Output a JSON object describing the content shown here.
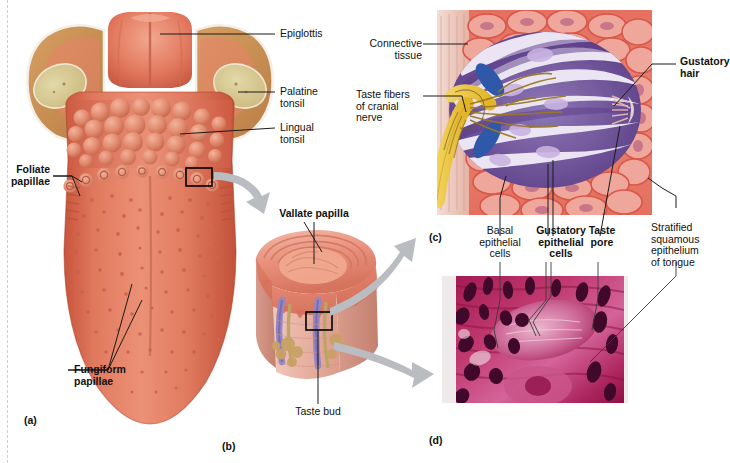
{
  "figure": {
    "background": "#ffffff"
  },
  "panels": [
    {
      "id": "a",
      "label": "(a)",
      "caption": "Superior view of the tongue showing papillae and tonsils"
    },
    {
      "id": "b",
      "label": "(b)",
      "caption": "Sectional view of a vallate papilla"
    },
    {
      "id": "c",
      "label": "(c)",
      "caption": "Enlarged view of a taste bud"
    },
    {
      "id": "d",
      "label": "(d)",
      "caption": "Photomicrograph of a taste bud"
    }
  ],
  "panel_a": {
    "labels": [
      {
        "id": "epiglottis",
        "text": "Epiglottis",
        "bold": false
      },
      {
        "id": "palatine-tonsil",
        "text": "Palatine\ntonsil",
        "bold": false
      },
      {
        "id": "lingual-tonsil",
        "text": "Lingual\ntonsil",
        "bold": false
      },
      {
        "id": "foliate-papillae",
        "text": "Foliate\npapillae",
        "bold": true
      },
      {
        "id": "fungiform-papillae",
        "text": "Fungiform\npapillae",
        "bold": true
      }
    ],
    "colors": {
      "tongue_body": "#de6a50",
      "tongue_light": "#ea8f75",
      "tongue_shadow": "#bf4c36",
      "tonsil_tissue": "#cf9a55",
      "tonsil_pale": "#ddd3a0",
      "epiglottis": "#e07f65"
    }
  },
  "panel_b": {
    "labels": [
      {
        "id": "vallate-papilla",
        "text": "Vallate papilla",
        "bold": true
      },
      {
        "id": "taste-bud",
        "text": "Taste bud",
        "bold": false
      }
    ],
    "colors": {
      "epithelium": "#e98f7c",
      "connective": "#f0c3b6",
      "muscle": "#e2a394",
      "gland": "#c8a264",
      "taste_bud": "#9b8cc4",
      "nerve": "#b9a06a"
    }
  },
  "panel_c": {
    "labels": [
      {
        "id": "connective-tissue",
        "text": "Connective\ntissue",
        "bold": false
      },
      {
        "id": "taste-fibers",
        "text": "Taste fibers\nof cranial\nnerve",
        "bold": false
      },
      {
        "id": "gustatory-hair",
        "text": "Gustatory\nhair",
        "bold": true
      },
      {
        "id": "basal-epithelial-cells",
        "text": "Basal\nepithelial\ncells",
        "bold": false
      },
      {
        "id": "gustatory-epithelial-cells",
        "text": "Gustatory\nepithelial\ncells",
        "bold": true
      },
      {
        "id": "taste-pore",
        "text": "Taste\npore",
        "bold": true
      },
      {
        "id": "stratified-squamous-epithelium",
        "text": "Stratified\nsquamous\nepithelium\nof tongue",
        "bold": false
      }
    ],
    "colors": {
      "epithelium": "#e0695c",
      "epithelium_cell": "#efa79b",
      "gustatory_cell": "#6c4a94",
      "gustatory_pale": "#efeaf6",
      "basal_cell": "#2f58a8",
      "nerve_yellow": "#ecc13e",
      "nerve_branch": "#9a7a22",
      "connective": "#e8b9ae"
    }
  },
  "panel_d": {
    "caption_label": "(d)",
    "colors": {
      "tissue": "#b8275f",
      "tissue_light": "#d8628e",
      "nuclei": "#4a0a2a",
      "background": "#efeaea"
    }
  },
  "connectors": [
    {
      "id": "arrow-a-to-b",
      "from": "panel-a-detail-box",
      "to": "panel-b"
    },
    {
      "id": "arrow-b-to-c",
      "from": "panel-b-detail-box",
      "to": "panel-c"
    },
    {
      "id": "arrow-b-to-d",
      "from": "panel-b-detail-box",
      "to": "panel-d"
    }
  ]
}
